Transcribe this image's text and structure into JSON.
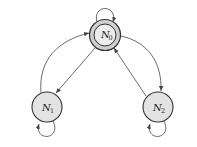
{
  "diagram": {
    "type": "state-machine",
    "colors": {
      "node_fill": "#e3e3e3",
      "node_stroke": "#333333",
      "edge": "#444444",
      "background": "#ffffff"
    },
    "nodes": [
      {
        "id": "N0",
        "label_main": "N",
        "label_sub": "0",
        "initial": true
      },
      {
        "id": "N1",
        "label_main": "N",
        "label_sub": "1"
      },
      {
        "id": "N2",
        "label_main": "N",
        "label_sub": "2"
      }
    ],
    "edges": [
      {
        "from": "N0",
        "to": "N0",
        "type": "self-loop"
      },
      {
        "from": "N1",
        "to": "N1",
        "type": "self-loop"
      },
      {
        "from": "N2",
        "to": "N2",
        "type": "self-loop"
      },
      {
        "from": "N0",
        "to": "N1",
        "type": "straight"
      },
      {
        "from": "N1",
        "to": "N0",
        "type": "curved"
      },
      {
        "from": "N2",
        "to": "N0",
        "type": "straight"
      },
      {
        "from": "N0",
        "to": "N2",
        "type": "curved"
      }
    ]
  }
}
